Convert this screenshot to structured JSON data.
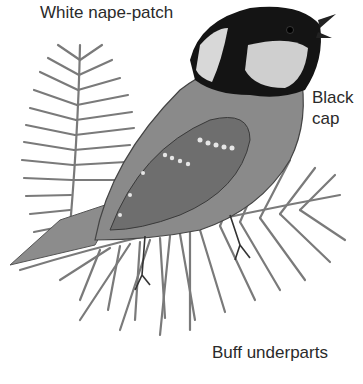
{
  "figure": {
    "labels": {
      "nape": "White nape-patch",
      "cap_line1": "Black",
      "cap_line2": "cap",
      "underparts": "Buff underparts"
    },
    "colors": {
      "background": "#ffffff",
      "cap": "#141414",
      "nape_patch": "#d8d8d8",
      "cheek": "#cfcfcf",
      "body": "#8a8a8a",
      "wing": "#6e6e6e",
      "needles": "#7a7a7a",
      "text": "#2a2a2a"
    }
  }
}
